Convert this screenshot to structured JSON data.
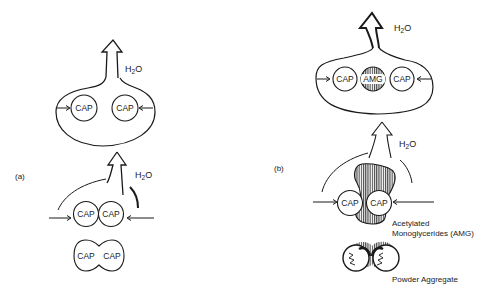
{
  "figure": {
    "panels": [
      {
        "id": "a",
        "label": "(a)",
        "stages": [
          {
            "name": "droplet",
            "water_label": "H2O",
            "particles": [
              "CAP",
              "CAP"
            ]
          },
          {
            "name": "contact",
            "water_label": "H2O",
            "particles": [
              "CAP",
              "CAP"
            ]
          },
          {
            "name": "fused",
            "particles": [
              "CAP",
              "CAP"
            ]
          }
        ]
      },
      {
        "id": "b",
        "label": "(b)",
        "stages": [
          {
            "name": "droplet",
            "water_label": "H2O",
            "particles": [
              "CAP",
              "AMG",
              "CAP"
            ]
          },
          {
            "name": "contact",
            "water_label": "H2O",
            "particles": [
              "CAP",
              "CAP"
            ],
            "binder_label_line1": "Acetylated",
            "binder_label_line2": "Monoglycerides (AMG)"
          },
          {
            "name": "aggregate",
            "caption": "Powder Aggregate"
          }
        ]
      }
    ],
    "colors": {
      "ink": "#1a1a1a",
      "background": "#ffffff"
    }
  }
}
